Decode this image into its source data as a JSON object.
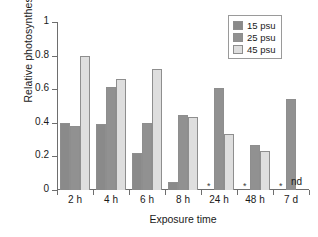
{
  "chart_data": {
    "type": "bar",
    "title": "",
    "xlabel": "Exposure time",
    "ylabel": "Relative photosynthesis",
    "categories": [
      "2 h",
      "4 h",
      "6 h",
      "8 h",
      "24 h",
      "48 h",
      "7 d"
    ],
    "ylim": [
      0,
      1
    ],
    "yticks": [
      "0",
      "0.2",
      "0.4",
      "0.6",
      "0.8",
      "1"
    ],
    "ytick_values": [
      0,
      0.2,
      0.4,
      0.6,
      0.8,
      1
    ],
    "grid": false,
    "legend_position": "top-right",
    "series": [
      {
        "name": "15 psu",
        "color": "#8a8a8a",
        "values": [
          0.4,
          0.395,
          0.22,
          0.045,
          0,
          0,
          0
        ]
      },
      {
        "name": "25 psu",
        "color": "#919191",
        "values": [
          0.38,
          0.615,
          0.4,
          0.445,
          0.605,
          0.27,
          0.54
        ]
      },
      {
        "name": "45 psu",
        "color": "#dedede",
        "values": [
          0.8,
          0.66,
          0.72,
          0.437,
          0.335,
          0.235,
          null
        ]
      }
    ],
    "annotations": [
      {
        "text": "*",
        "category": "24 h",
        "series": "15 psu",
        "meaning": "zero-value marker"
      },
      {
        "text": "*",
        "category": "48 h",
        "series": "15 psu",
        "meaning": "zero-value marker"
      },
      {
        "text": "*",
        "category": "7 d",
        "series": "15 psu",
        "meaning": "zero-value marker"
      },
      {
        "text": "nd",
        "category": "7 d",
        "series": "45 psu",
        "meaning": "not determined"
      }
    ]
  },
  "legend": {
    "items": [
      {
        "label": "15 psu"
      },
      {
        "label": "25 psu"
      },
      {
        "label": "45 psu"
      }
    ]
  },
  "nd_label": "nd"
}
